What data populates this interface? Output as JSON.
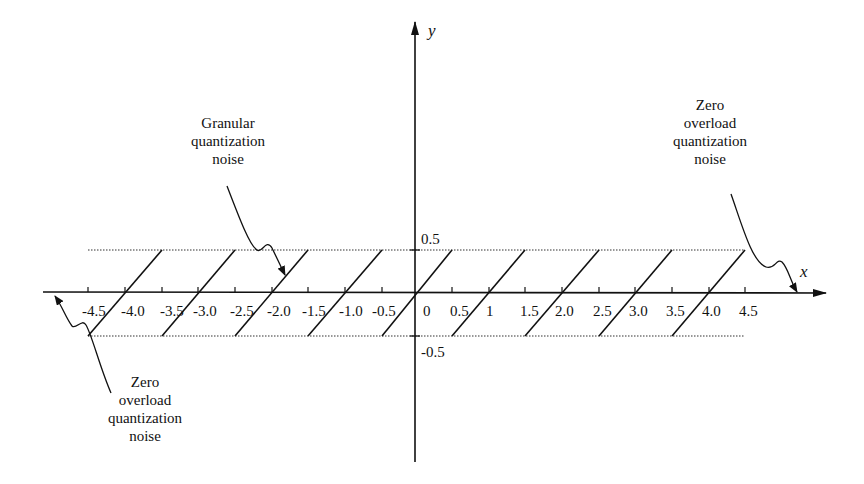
{
  "diagram": {
    "axes": {
      "x_label": "x",
      "y_label": "y",
      "x_ticks": [
        "-4.5",
        "-4.0",
        "-3.5",
        "-3.0",
        "-2.5",
        "-2.0",
        "-1.5",
        "-1.0",
        "-0.5",
        "0",
        "0.5",
        "1",
        "1.5",
        "2.0",
        "2.5",
        "3.0",
        "3.5",
        "4.0",
        "4.5"
      ],
      "y_ticks": [
        "0.5",
        "-0.5"
      ]
    },
    "annotations": {
      "granular": [
        "Granular",
        "quantization",
        "noise"
      ],
      "overload_right": [
        "Zero",
        "overload",
        "quantization",
        "noise"
      ],
      "overload_left": [
        "Zero",
        "overload",
        "quantization",
        "noise"
      ]
    },
    "colors": {
      "ink": "#111111",
      "background": "#ffffff"
    }
  }
}
